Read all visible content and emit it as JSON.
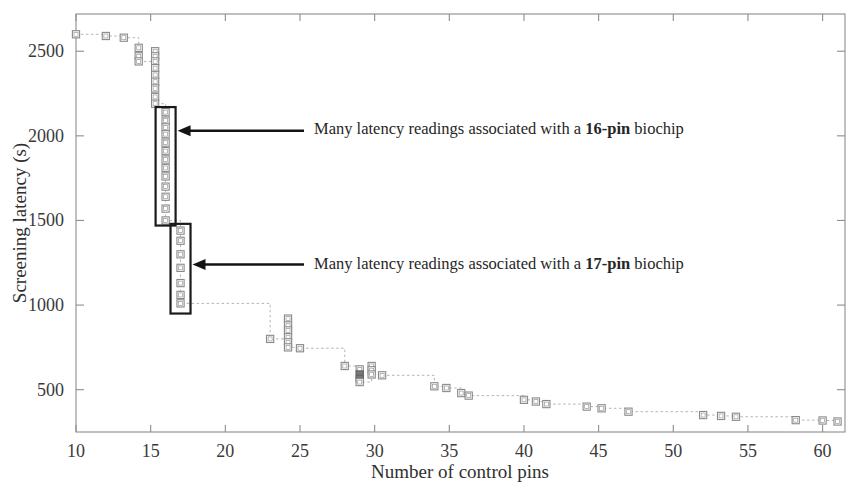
{
  "figure": {
    "title": "",
    "background_color": "#ffffff"
  },
  "chart_data": {
    "type": "scatter",
    "title": "",
    "xlabel": "Number of control pins",
    "ylabel": "Screening latency (s)",
    "xlim": [
      10,
      61.5
    ],
    "ylim": [
      250,
      2720
    ],
    "xticks": [
      10,
      15,
      20,
      25,
      30,
      35,
      40,
      45,
      50,
      55,
      60
    ],
    "xtick_labels": [
      "10",
      "15",
      "20",
      "25",
      "30",
      "35",
      "40",
      "45",
      "50",
      "55",
      "60"
    ],
    "yticks": [
      500,
      1000,
      1500,
      2000,
      2500
    ],
    "ytick_labels": [
      "500",
      "1000",
      "1500",
      "2000",
      "2500"
    ],
    "grid": false,
    "legend": null,
    "marker_style": "open square with dotted step connector",
    "series": [
      {
        "name": "Screening latency vs control pins",
        "line_style": "dotted step",
        "marker": "square",
        "points": [
          {
            "x": 10.0,
            "y": 2600
          },
          {
            "x": 12.0,
            "y": 2590
          },
          {
            "x": 13.2,
            "y": 2580
          },
          {
            "x": 14.2,
            "y": 2520
          },
          {
            "x": 14.2,
            "y": 2470
          },
          {
            "x": 14.2,
            "y": 2440
          },
          {
            "x": 15.3,
            "y": 2500
          },
          {
            "x": 15.3,
            "y": 2470
          },
          {
            "x": 15.3,
            "y": 2440
          },
          {
            "x": 15.3,
            "y": 2400
          },
          {
            "x": 15.3,
            "y": 2360
          },
          {
            "x": 15.3,
            "y": 2320
          },
          {
            "x": 15.3,
            "y": 2280
          },
          {
            "x": 15.3,
            "y": 2230
          },
          {
            "x": 15.3,
            "y": 2190
          },
          {
            "x": 16.0,
            "y": 2140
          },
          {
            "x": 16.0,
            "y": 2090
          },
          {
            "x": 16.0,
            "y": 2050
          },
          {
            "x": 16.0,
            "y": 2010
          },
          {
            "x": 16.0,
            "y": 1960
          },
          {
            "x": 16.0,
            "y": 1910
          },
          {
            "x": 16.0,
            "y": 1860
          },
          {
            "x": 16.0,
            "y": 1810
          },
          {
            "x": 16.0,
            "y": 1760
          },
          {
            "x": 16.0,
            "y": 1700
          },
          {
            "x": 16.0,
            "y": 1640
          },
          {
            "x": 16.0,
            "y": 1570
          },
          {
            "x": 16.0,
            "y": 1500
          },
          {
            "x": 17.0,
            "y": 1440
          },
          {
            "x": 17.0,
            "y": 1380
          },
          {
            "x": 17.0,
            "y": 1300
          },
          {
            "x": 17.0,
            "y": 1220
          },
          {
            "x": 17.0,
            "y": 1130
          },
          {
            "x": 17.0,
            "y": 1060
          },
          {
            "x": 17.0,
            "y": 1010
          },
          {
            "x": 23.0,
            "y": 800
          },
          {
            "x": 24.2,
            "y": 920
          },
          {
            "x": 24.2,
            "y": 880
          },
          {
            "x": 24.2,
            "y": 850
          },
          {
            "x": 24.2,
            "y": 810
          },
          {
            "x": 24.2,
            "y": 780
          },
          {
            "x": 24.2,
            "y": 750
          },
          {
            "x": 25.0,
            "y": 745
          },
          {
            "x": 28.0,
            "y": 640
          },
          {
            "x": 29.0,
            "y": 620
          },
          {
            "x": 29.0,
            "y": 590
          },
          {
            "x": 29.0,
            "y": 565
          },
          {
            "x": 29.0,
            "y": 545
          },
          {
            "x": 29.8,
            "y": 640
          },
          {
            "x": 29.8,
            "y": 615
          },
          {
            "x": 29.8,
            "y": 590
          },
          {
            "x": 30.5,
            "y": 585
          },
          {
            "x": 34.0,
            "y": 520
          },
          {
            "x": 34.8,
            "y": 510
          },
          {
            "x": 35.8,
            "y": 480
          },
          {
            "x": 36.3,
            "y": 465
          },
          {
            "x": 40.0,
            "y": 440
          },
          {
            "x": 40.8,
            "y": 430
          },
          {
            "x": 41.5,
            "y": 415
          },
          {
            "x": 44.2,
            "y": 400
          },
          {
            "x": 45.2,
            "y": 390
          },
          {
            "x": 47.0,
            "y": 370
          },
          {
            "x": 52.0,
            "y": 350
          },
          {
            "x": 53.2,
            "y": 345
          },
          {
            "x": 54.2,
            "y": 340
          },
          {
            "x": 58.2,
            "y": 320
          },
          {
            "x": 60.0,
            "y": 318
          },
          {
            "x": 61.0,
            "y": 312
          }
        ]
      }
    ],
    "annotations": [
      {
        "id": "annot-16-pin",
        "text_prefix": "Many latency readings associated with a ",
        "text_bold": "16-pin",
        "text_suffix": " biochip",
        "full_text": "Many latency readings associated with a 16-pin biochip",
        "arrow_target_x": 16.0,
        "arrow_target_y": 2030,
        "highlight_box": {
          "x_center": 16.0,
          "y_top": 2170,
          "y_bottom": 1470
        }
      },
      {
        "id": "annot-17-pin",
        "text_prefix": "Many latency readings associated with a ",
        "text_bold": "17-pin",
        "text_suffix": " biochip",
        "full_text": "Many latency readings associated with a 17-pin biochip",
        "arrow_target_x": 17.0,
        "arrow_target_y": 1240,
        "highlight_box": {
          "x_center": 17.0,
          "y_top": 1480,
          "y_bottom": 950
        }
      }
    ],
    "colors": {
      "axis": "#8d8d8d",
      "marker_edge": "#8a8a8a",
      "marker_fill": "#ffffff",
      "dense_marker": "#7a7a7a",
      "connector": "#b4b4b4",
      "annotation": "#141414",
      "text": "#2b2b2b"
    }
  },
  "axes": {
    "x_axis_title": "Number of control pins",
    "y_axis_title": "Screening latency (s)"
  }
}
